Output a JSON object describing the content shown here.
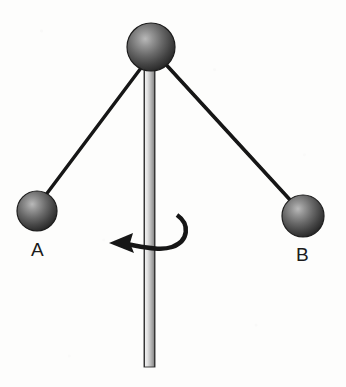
{
  "figure": {
    "kind": "physics-diagram",
    "background_color": "#fdfdfc",
    "ink_color": "#1b1b1b"
  },
  "labels": {
    "ball_a": "A",
    "ball_b": "B"
  },
  "balls": [
    {
      "id": "pivot-ball",
      "name": "pivot-ball",
      "cx": 151,
      "cy": 47,
      "r": 24,
      "fill_dark": "#2b2b2b",
      "fill_light": "#9a9a9a"
    },
    {
      "id": "ball-a",
      "name": "ball-a",
      "label": "A",
      "cx": 37,
      "cy": 211,
      "r": 20,
      "fill_dark": "#2b2b2b",
      "fill_light": "#9a9a9a"
    },
    {
      "id": "ball-b",
      "name": "ball-b",
      "label": "B",
      "cx": 303,
      "cy": 216,
      "r": 21,
      "fill_dark": "#2b2b2b",
      "fill_light": "#9a9a9a"
    }
  ],
  "strings": [
    {
      "id": "string-a",
      "x1": 147,
      "y1": 60,
      "x2": 45,
      "y2": 196,
      "width": 3.4
    },
    {
      "id": "string-b",
      "x1": 160,
      "y1": 58,
      "x2": 292,
      "y2": 202,
      "width": 3.6
    }
  ],
  "rod": {
    "x": 144,
    "y_top": 55,
    "y_bottom": 367,
    "width": 11,
    "edge_color": "#3a3a3a",
    "fill_light": "#e7e7e7",
    "fill_shadow": "#9d9d9d"
  },
  "rotation_arrow": {
    "id": "rotation-arrow",
    "direction": "counterclockwise-viewed-from-above",
    "arrowhead_tip_x": 109,
    "arrowhead_tip_y": 243,
    "arc_start_x": 177,
    "arc_start_y": 215,
    "stroke_width": 4.5,
    "color": "#141414"
  }
}
